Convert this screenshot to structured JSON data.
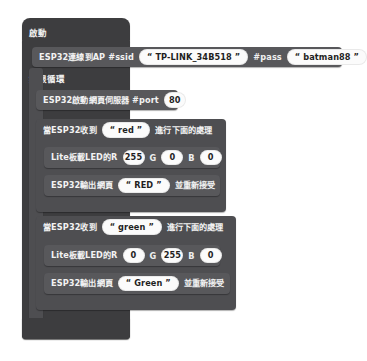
{
  "app": {
    "kind": "blockly-workspace",
    "language": "zh-Hant",
    "background_color": "#ffffff"
  },
  "palette": {
    "hat_block": "#3d3d3f",
    "container_block": "#4e4e51",
    "statement_block": "#58585b",
    "field_pill": "#fbfbfb",
    "text_on_block": "#f2f2f2",
    "text_in_pill": "#1f1f1f"
  },
  "program": {
    "start_block": {
      "label": "啟動"
    },
    "wifi_connect": {
      "prefix": "ESP32連線到AP #ssid",
      "ssid_value": "“ TP-LINK_34B518 ”",
      "pass_label": "#pass",
      "pass_value": "“ batman88 ”"
    },
    "loop_block": {
      "label": "無限循環"
    },
    "web_server": {
      "prefix": "ESP32啟動網頁伺服器 #port",
      "port_value": "80"
    },
    "cases": [
      {
        "when_prefix": "當ESP32收到",
        "when_value": "“ red ”",
        "when_suffix": "進行下面的處理",
        "led_prefix": "Lite板載LED的R",
        "led_r": "255",
        "led_g_label": "G",
        "led_g": "0",
        "led_b_label": "B",
        "led_b": "0",
        "out_prefix": "ESP32輸出網頁",
        "out_value": "“ RED ”",
        "out_suffix": "並重新接受"
      },
      {
        "when_prefix": "當ESP32收到",
        "when_value": "“ green ”",
        "when_suffix": "進行下面的處理",
        "led_prefix": "Lite板載LED的R",
        "led_r": "0",
        "led_g_label": "G",
        "led_g": "255",
        "led_b_label": "B",
        "led_b": "0",
        "out_prefix": "ESP32輸出網頁",
        "out_value": "“ Green ”",
        "out_suffix": "並重新接受"
      }
    ]
  }
}
